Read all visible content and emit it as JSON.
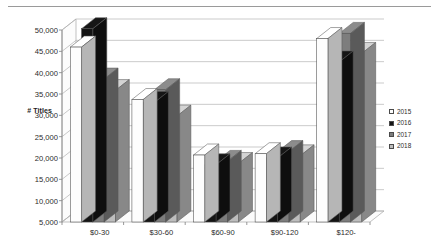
{
  "chart_data": {
    "type": "bar",
    "title": "",
    "xlabel": "",
    "ylabel": "# Titles",
    "categories": [
      "$0-30",
      "$30-60",
      "$60-90",
      "$90-120",
      "$120-"
    ],
    "series": [
      {
        "name": "2015",
        "color": "#fdfdfd",
        "values": [
          46000,
          33700,
          20700,
          21000,
          48000
        ]
      },
      {
        "name": "2016",
        "color": "#141414",
        "values": [
          50300,
          33000,
          18400,
          20000,
          42500
        ]
      },
      {
        "name": "2017",
        "color": "#7d7d7d",
        "values": [
          38500,
          36000,
          19200,
          21500,
          49200
        ]
      },
      {
        "name": "2018",
        "color": "#bdbdbd",
        "values": [
          35800,
          29800,
          18700,
          20500,
          44500
        ]
      }
    ],
    "ylim": [
      5000,
      50000
    ],
    "ytick_step": 5000,
    "yticks": [
      "50,000",
      "45,000",
      "40,000",
      "35,000",
      "30,000",
      "25,000",
      "20,000",
      "15,000",
      "10,000",
      "5,000"
    ],
    "ytick_values": [
      50000,
      45000,
      40000,
      35000,
      30000,
      25000,
      20000,
      15000,
      10000,
      5000
    ],
    "grid": true,
    "legend_position": "right",
    "style": "3d-clustered-column"
  },
  "legend": {
    "items": [
      {
        "label": "2015",
        "swatch": "#fdfdfd"
      },
      {
        "label": "2016",
        "swatch": "#141414"
      },
      {
        "label": "2017",
        "swatch": "#7d7d7d"
      },
      {
        "label": "2018",
        "swatch": "#bdbdbd"
      }
    ]
  }
}
